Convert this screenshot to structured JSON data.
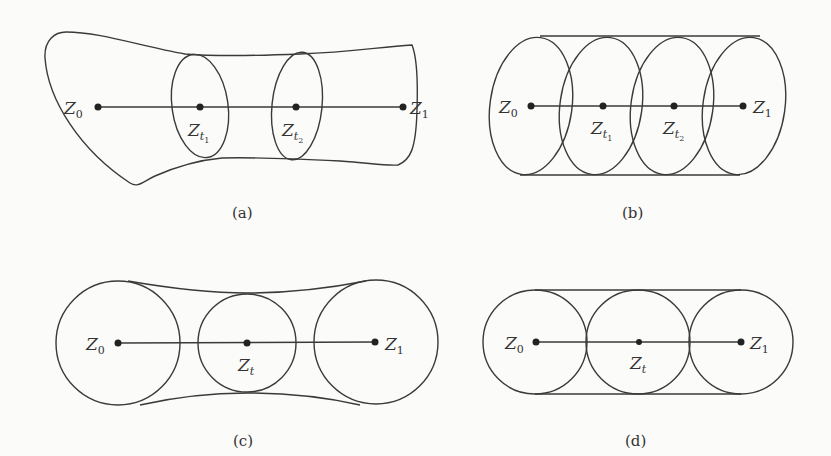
{
  "figure": {
    "panels": [
      {
        "id": "a",
        "caption": "(a)",
        "description": "Irregular tube region between Z0 and Z1 with two elliptical cross-sections",
        "labels": {
          "start": "Z",
          "start_sub": "0",
          "end": "Z",
          "end_sub": "1",
          "mid1": "Z",
          "mid1_sub": "t",
          "mid1_subsub": "1",
          "mid2": "Z",
          "mid2_sub": "t",
          "mid2_subsub": "2"
        }
      },
      {
        "id": "b",
        "caption": "(b)",
        "description": "Cylinder of four overlapping ellipses along segment Z0–Z1",
        "labels": {
          "start": "Z",
          "start_sub": "0",
          "end": "Z",
          "end_sub": "1",
          "mid1": "Z",
          "mid1_sub": "t",
          "mid1_subsub": "1",
          "mid2": "Z",
          "mid2_sub": "t",
          "mid2_subsub": "2"
        }
      },
      {
        "id": "c",
        "caption": "(c)",
        "description": "Two large circles at Z0 and Z1 connected by concave hull through a smaller circle at Zt",
        "labels": {
          "start": "Z",
          "start_sub": "0",
          "end": "Z",
          "end_sub": "1",
          "mid": "Z",
          "mid_sub": "t"
        }
      },
      {
        "id": "d",
        "caption": "(d)",
        "description": "Three equal tangent circles at Z0, Zt, Z1 enclosed by straight tangent lines",
        "labels": {
          "start": "Z",
          "start_sub": "0",
          "end": "Z",
          "end_sub": "1",
          "mid": "Z",
          "mid_sub": "t"
        }
      }
    ]
  }
}
